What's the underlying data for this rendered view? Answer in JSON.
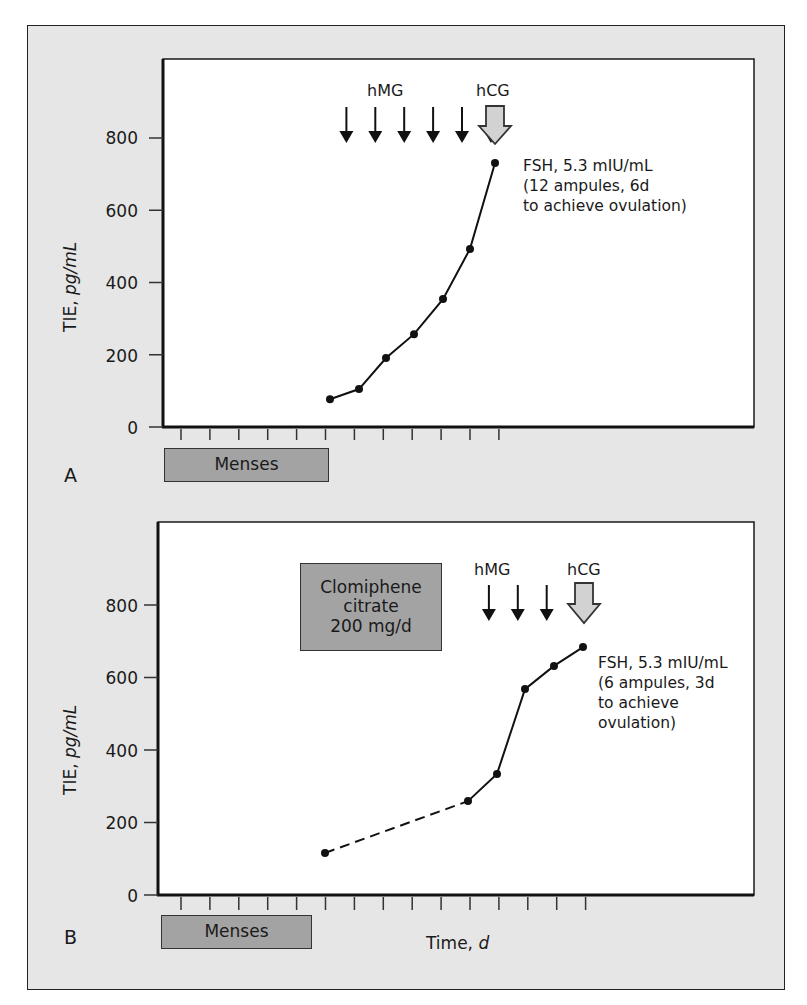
{
  "figure": {
    "panels": [
      {
        "letter": "A",
        "y_axis_label_main": "TIE, ",
        "y_axis_label_unit": "pg/mL",
        "y_ticks": [
          "0",
          "200",
          "400",
          "600",
          "800"
        ],
        "menses_label": "Menses",
        "hmg_label": "hMG",
        "hcg_label": "hCG",
        "hmg_arrow_count": 6,
        "note": "FSH, 5.3 mIU/mL\n(12 ampules, 6d\nto achieve ovulation)"
      },
      {
        "letter": "B",
        "y_axis_label_main": "TIE, ",
        "y_axis_label_unit": "pg/mL",
        "y_ticks": [
          "0",
          "200",
          "400",
          "600",
          "800"
        ],
        "menses_label": "Menses",
        "clomiphene_label": "Clomiphene\ncitrate\n200 mg/d",
        "hmg_label": "hMG",
        "hcg_label": "hCG",
        "hmg_arrow_count": 3,
        "note": "FSH, 5.3 mIU/mL\n(6 ampules, 3d\nto achieve\novulation)",
        "x_axis_label_main": "Time, ",
        "x_axis_label_unit": "d"
      }
    ]
  },
  "chart_data": [
    {
      "type": "line",
      "panel": "A",
      "title": "",
      "xlabel": "Time, d",
      "ylabel": "TIE, pg/mL",
      "ylim": [
        0,
        950
      ],
      "yticks": [
        0,
        200,
        400,
        600,
        800
      ],
      "x_tick_count": 12,
      "grid": false,
      "legend": null,
      "x": [
        6,
        7,
        8,
        9,
        10,
        11,
        12
      ],
      "series": [
        {
          "name": "TIE",
          "style": "solid",
          "values": [
            77,
            105,
            191,
            257,
            354,
            493,
            731
          ]
        }
      ],
      "annotations": [
        {
          "text": "Menses",
          "x_range": [
            0,
            6
          ]
        },
        {
          "text": "hMG",
          "arrows_at_x": [
            6,
            7,
            8,
            9,
            10,
            11
          ]
        },
        {
          "text": "hCG",
          "arrow_at_x": 12
        },
        {
          "text": "FSH, 5.3 mIU/mL (12 ampules, 6d to achieve ovulation)"
        }
      ]
    },
    {
      "type": "line",
      "panel": "B",
      "title": "",
      "xlabel": "Time, d",
      "ylabel": "TIE, pg/mL",
      "ylim": [
        0,
        950
      ],
      "yticks": [
        0,
        200,
        400,
        600,
        800
      ],
      "x_tick_count": 15,
      "grid": false,
      "legend": null,
      "x": [
        6,
        11,
        12,
        13,
        14,
        15
      ],
      "series": [
        {
          "name": "TIE (dashed segment)",
          "style": "dashed",
          "x": [
            6,
            11
          ],
          "values": [
            116,
            259
          ]
        },
        {
          "name": "TIE (solid segment)",
          "style": "solid",
          "x": [
            11,
            12,
            13,
            14,
            15
          ],
          "values": [
            259,
            334,
            568,
            632,
            684
          ]
        }
      ],
      "annotations": [
        {
          "text": "Menses",
          "x_range": [
            0,
            5
          ]
        },
        {
          "text": "Clomiphene citrate 200 mg/d"
        },
        {
          "text": "hMG",
          "arrows_at_x": [
            11,
            12,
            13
          ]
        },
        {
          "text": "hCG",
          "arrow_at_x": 15
        },
        {
          "text": "FSH, 5.3 mIU/mL (6 ampules, 3d to achieve ovulation)"
        }
      ]
    }
  ]
}
